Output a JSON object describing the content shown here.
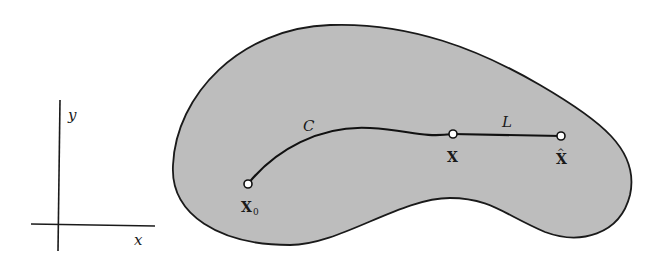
{
  "axes": {
    "x_label": "x",
    "y_label": "y"
  },
  "region": {
    "fill": "#bdbdbd",
    "stroke": "#1a1a1a"
  },
  "curve": {
    "label": "C"
  },
  "segment": {
    "label": "L"
  },
  "points": {
    "start": {
      "label": "X",
      "subscript": "0"
    },
    "mid": {
      "label": "X"
    },
    "end": {
      "label": "X",
      "accent": "^"
    }
  }
}
